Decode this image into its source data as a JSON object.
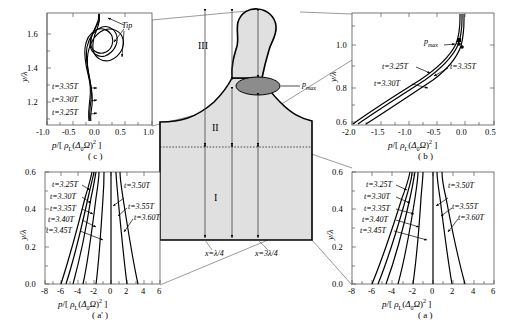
{
  "figure": {
    "type": "multi-panel scientific figure"
  },
  "axis_labels": {
    "x": "p/[ ρʟ(Δ₀Ω)² ]",
    "x_parts": {
      "num": "p/[ ",
      "rho": "ρ",
      "sub_L": "L",
      "open": "(",
      "delta": "Δ",
      "sub0": "0",
      "omega": "Ω",
      "close": ")",
      "exp": "2",
      "end": " ]"
    },
    "y": "y/λ"
  },
  "panels": [
    {
      "id": "c",
      "caption": "( c )",
      "position": "top-left",
      "xlim": [
        -1.0,
        1.0
      ],
      "ylim": [
        1.1,
        1.72
      ],
      "xticks": [
        -1.0,
        -0.5,
        0.0,
        0.5,
        1.0
      ],
      "xticklabels": [
        "-1.0",
        "-0.5",
        "0.0",
        "0.5",
        "1.0"
      ],
      "yticks": [
        1.2,
        1.4,
        1.6
      ],
      "yticklabels": [
        "1.2",
        "1.4",
        "1.6"
      ],
      "annotations": [
        {
          "text": "Tip",
          "kind": "pointer-label"
        },
        {
          "text": "t=3.35T",
          "kind": "curve-label"
        },
        {
          "text": "t=3.30T",
          "kind": "curve-label"
        },
        {
          "text": "t=3.25T",
          "kind": "curve-label"
        }
      ],
      "curves": [
        {
          "name": "t=3.25T"
        },
        {
          "name": "t=3.30T"
        },
        {
          "name": "t=3.35T"
        }
      ]
    },
    {
      "id": "b",
      "caption": "( b )",
      "position": "top-right",
      "xlim": [
        -2.0,
        0.5
      ],
      "ylim": [
        0.6,
        1.08
      ],
      "xticks": [
        -2.0,
        -1.5,
        -1.0,
        -0.5,
        0.0,
        0.5
      ],
      "xticklabels": [
        "-2.0",
        "-1.5",
        "-1.0",
        "-0.5",
        "0.0",
        "0.5"
      ],
      "yticks": [
        0.6,
        0.8,
        1.0
      ],
      "yticklabels": [
        "0.6",
        "0.8",
        "1.0"
      ],
      "annotations": [
        {
          "text": "p",
          "sub": "max",
          "kind": "point-label"
        },
        {
          "text": "t=3.25T",
          "kind": "curve-label"
        },
        {
          "text": "t=3.30T",
          "kind": "curve-label"
        },
        {
          "text": "t=3.35T",
          "kind": "curve-label"
        }
      ],
      "curves": [
        {
          "name": "t=3.25T"
        },
        {
          "name": "t=3.30T"
        },
        {
          "name": "t=3.35T"
        }
      ]
    },
    {
      "id": "a-prime",
      "caption": "( a' )",
      "position": "bottom-left",
      "xlim": [
        -8,
        6
      ],
      "ylim": [
        0.0,
        0.62
      ],
      "xticks": [
        -8,
        -6,
        -4,
        -2,
        0,
        2,
        4,
        6
      ],
      "xticklabels": [
        "-8",
        "-6",
        "-4",
        "-2",
        "0",
        "2",
        "4",
        "6"
      ],
      "yticks": [
        0.0,
        0.2,
        0.4,
        0.6
      ],
      "yticklabels": [
        "0.0",
        "0.2",
        "0.4",
        "0.6"
      ],
      "annotations": [
        {
          "text": "t=3.25T",
          "kind": "curve-label"
        },
        {
          "text": "t=3.30T",
          "kind": "curve-label"
        },
        {
          "text": "t=3.35T",
          "kind": "curve-label"
        },
        {
          "text": "t=3.40T",
          "kind": "curve-label"
        },
        {
          "text": "t=3.45T",
          "kind": "curve-label"
        },
        {
          "text": "t=3.50T",
          "kind": "curve-label"
        },
        {
          "text": "t=3.55T",
          "kind": "curve-label"
        },
        {
          "text": "t=3.60T",
          "kind": "curve-label"
        }
      ],
      "curves": [
        {
          "name": "t=3.25T",
          "x_at_y0": -6.2
        },
        {
          "name": "t=3.30T",
          "x_at_y0": -5.6
        },
        {
          "name": "t=3.35T",
          "x_at_y0": -4.8
        },
        {
          "name": "t=3.40T",
          "x_at_y0": -3.6
        },
        {
          "name": "t=3.45T",
          "x_at_y0": -2.0
        },
        {
          "name": "t=3.50T",
          "x_at_y0": 0.0
        },
        {
          "name": "t=3.55T",
          "x_at_y0": 1.9
        },
        {
          "name": "t=3.60T",
          "x_at_y0": 3.2
        }
      ]
    },
    {
      "id": "a",
      "caption": "( a )",
      "position": "bottom-right",
      "xlim": [
        -8,
        6
      ],
      "ylim": [
        0.0,
        0.62
      ],
      "xticks": [
        -8,
        -6,
        -4,
        -2,
        0,
        2,
        4,
        6
      ],
      "xticklabels": [
        "-8",
        "-6",
        "-4",
        "-2",
        "0",
        "2",
        "4",
        "6"
      ],
      "yticks": [
        0.0,
        0.2,
        0.4,
        0.6
      ],
      "yticklabels": [
        "0.0",
        "0.2",
        "0.4",
        "0.6"
      ],
      "annotations": [
        {
          "text": "t=3.25T",
          "kind": "curve-label"
        },
        {
          "text": "t=3.30T",
          "kind": "curve-label"
        },
        {
          "text": "t=3.35T",
          "kind": "curve-label"
        },
        {
          "text": "t=3.40T",
          "kind": "curve-label"
        },
        {
          "text": "t=3.45T",
          "kind": "curve-label"
        },
        {
          "text": "t=3.50T",
          "kind": "curve-label"
        },
        {
          "text": "t=3.55T",
          "kind": "curve-label"
        },
        {
          "text": "t=3.60T",
          "kind": "curve-label"
        }
      ],
      "curves": [
        {
          "name": "t=3.25T",
          "x_at_y0": -6.2
        },
        {
          "name": "t=3.30T",
          "x_at_y0": -5.6
        },
        {
          "name": "t=3.35T",
          "x_at_y0": -4.8
        },
        {
          "name": "t=3.40T",
          "x_at_y0": -3.6
        },
        {
          "name": "t=3.45T",
          "x_at_y0": -2.0
        },
        {
          "name": "t=3.50T",
          "x_at_y0": 0.0
        },
        {
          "name": "t=3.55T",
          "x_at_y0": 1.9
        },
        {
          "name": "t=3.60T",
          "x_at_y0": 3.2
        }
      ]
    }
  ],
  "schematic": {
    "regions": [
      {
        "label": "I",
        "desc": "lower bulk region"
      },
      {
        "label": "II",
        "desc": "middle region below neck"
      },
      {
        "label": "III",
        "desc": "upper spike/jet region"
      }
    ],
    "pmax_label": {
      "text": "p",
      "sub": "max"
    },
    "position_labels": [
      {
        "text": "x=λ/4",
        "parts": {
          "var": "x",
          "eq": "=",
          "val": "λ/4"
        }
      },
      {
        "text": "x=3λ/4",
        "parts": {
          "var": "x",
          "eq": "=",
          "val": "3λ/4"
        }
      }
    ],
    "fill_color": "#e0e0e0",
    "pmax_ellipse_color": "#8c8c8c",
    "outline_color": "#000000"
  }
}
